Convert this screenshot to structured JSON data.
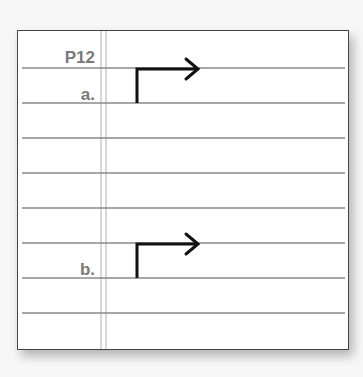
{
  "worksheet": {
    "problem_number": "P12",
    "items": [
      {
        "label": "a.",
        "diagram": "right-angle-arrow-icon"
      },
      {
        "label": "b.",
        "diagram": "right-angle-arrow-icon"
      }
    ],
    "ruled_line_count": 8,
    "colors": {
      "border": "#444444",
      "rule": "#8a8a8a",
      "margin_rule": "#b0b0b0",
      "label": "#7a7a7a",
      "arrow": "#111111"
    }
  }
}
